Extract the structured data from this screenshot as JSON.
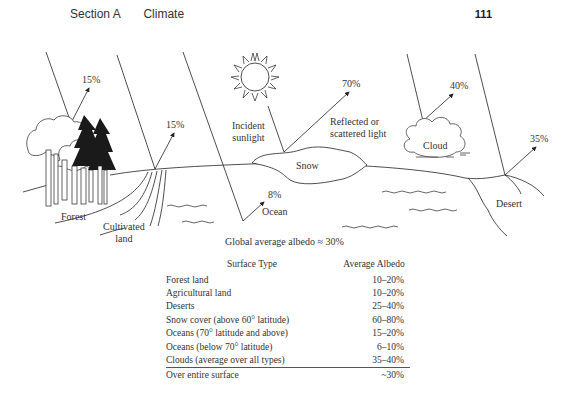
{
  "header": {
    "section": "Section A",
    "chapter": "Climate",
    "page_number": "111"
  },
  "diagram": {
    "labels": {
      "forest_pct": "15%",
      "cultivated_pct": "15%",
      "snow_pct": "70%",
      "cloud_pct": "40%",
      "desert_pct": "35%",
      "ocean_pct": "8%",
      "incident_line1": "Incident",
      "incident_line2": "sunlight",
      "reflected_line1": "Reflected or",
      "reflected_line2": "scattered light",
      "snow": "Snow",
      "cloud": "Cloud",
      "ocean": "Ocean",
      "desert": "Desert",
      "forest": "Forest",
      "cultivated_line1": "Cultivated",
      "cultivated_line2": "land"
    },
    "caption": "Global average albedo ≈ 30%"
  },
  "table": {
    "headers": [
      "Surface Type",
      "Average Albedo"
    ],
    "rows": [
      {
        "surface": "Forest land",
        "albedo": "10–20%"
      },
      {
        "surface": "Agricultural land",
        "albedo": "10–20%"
      },
      {
        "surface": "Deserts",
        "albedo": "25–40%"
      },
      {
        "surface": "Snow cover (above 60° latitude)",
        "albedo": "60–80%"
      },
      {
        "surface": "Oceans (70° latitude and above)",
        "albedo": "15–20%"
      },
      {
        "surface": "Oceans (below 70° latitude)",
        "albedo": "6–10%"
      },
      {
        "surface": "Clouds (average over all types)",
        "albedo": "35–40%"
      }
    ],
    "total": {
      "surface": "Over entire surface",
      "albedo": "~30%"
    }
  }
}
